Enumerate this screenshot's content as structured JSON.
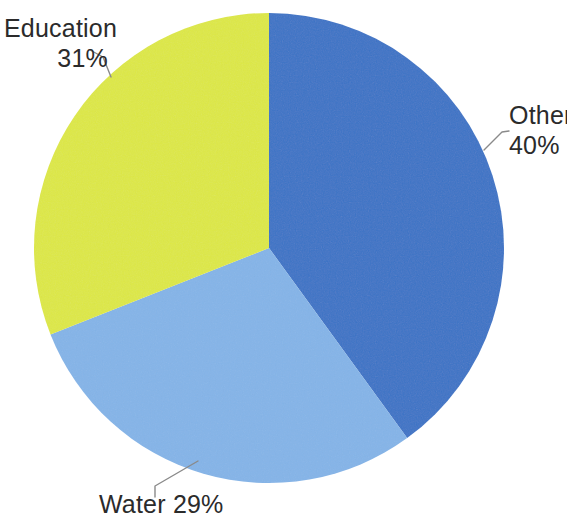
{
  "figure": {
    "width": 567,
    "height": 521,
    "background_color": "#ffffff"
  },
  "chart_data": {
    "type": "pie",
    "title": "",
    "subtitle": "",
    "xlabel": "",
    "ylabel": "",
    "grid": false,
    "legend_position": "none",
    "labels_position": "outside-with-leader-lines",
    "units": "percent",
    "start_angle_deg": 0,
    "direction": "clockwise",
    "categories": [
      "Other",
      "Water",
      "Education"
    ],
    "values": [
      40,
      29,
      31
    ],
    "colors": [
      "#3b73c6",
      "#84b4e8",
      "#dde844"
    ],
    "slices": [
      {
        "name": "Other",
        "value": 40,
        "value_text": "40%",
        "color": "#3b73c6",
        "start_angle_deg": 0,
        "end_angle_deg": 144
      },
      {
        "name": "Water",
        "value": 29,
        "value_text": "29%",
        "color": "#84b4e8",
        "start_angle_deg": 144,
        "end_angle_deg": 248.4
      },
      {
        "name": "Education",
        "value": 31,
        "value_text": "31%",
        "color": "#dde844",
        "start_angle_deg": 248.4,
        "end_angle_deg": 360
      }
    ],
    "geometry": {
      "center_x": 269,
      "center_y": 248,
      "radius": 235
    }
  },
  "labels": {
    "education": {
      "name": "Education",
      "percent": "31%"
    },
    "other": {
      "name": "Other",
      "percent": "40%"
    },
    "water": {
      "text": "Water 29%"
    }
  },
  "leader_lines": {
    "color": "#8a8a8a",
    "width": 1.4
  }
}
